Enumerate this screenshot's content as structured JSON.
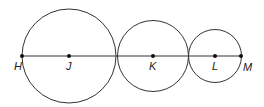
{
  "diagram": {
    "type": "tangent-circles",
    "line": {
      "from": "H",
      "to": "M"
    },
    "points": [
      {
        "label": "H",
        "x": 22,
        "y": 56
      },
      {
        "label": "J",
        "x": 69,
        "y": 56
      },
      {
        "label": "K",
        "x": 153,
        "y": 56
      },
      {
        "label": "L",
        "x": 215,
        "y": 56
      },
      {
        "label": "M",
        "x": 241,
        "y": 56
      }
    ],
    "circles": [
      {
        "center": "J",
        "cx": 69,
        "cy": 56,
        "r": 47
      },
      {
        "center": "K",
        "cx": 153,
        "cy": 56,
        "r": 35.5
      },
      {
        "center": "L",
        "cx": 215,
        "cy": 56,
        "r": 26.5
      }
    ],
    "stroke_color": "#333333"
  }
}
